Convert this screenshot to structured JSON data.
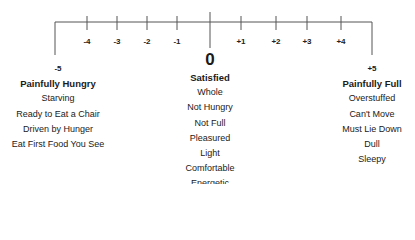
{
  "scale": {
    "ticks": [
      "-4",
      "-3",
      "-2",
      "-1",
      "+1",
      "+2",
      "+3",
      "+4"
    ],
    "left_end": "-5",
    "center": "0",
    "right_end": "+5"
  },
  "columns": {
    "hungry": {
      "value": "-5",
      "heading": "Painfully Hungry",
      "items": [
        "Starving",
        "Ready to Eat a Chair",
        "Driven by Hunger",
        "Eat First Food You See"
      ]
    },
    "satisfied": {
      "value": "0",
      "heading": "Satisfied",
      "items": [
        "Whole",
        "Not Hungry",
        "Not Full",
        "Pleasured",
        "Light",
        "Comfortable",
        "Energetic"
      ]
    },
    "full": {
      "value": "+5",
      "heading": "Painfully Full",
      "items": [
        "Overstuffed",
        "Can't Move",
        "Must Lie Down",
        "Dull",
        "Sleepy"
      ]
    }
  },
  "colors": {
    "line": "#555555",
    "text": "#1a1a1a"
  }
}
